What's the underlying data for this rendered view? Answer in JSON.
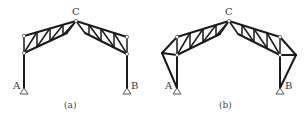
{
  "figures": [
    {
      "id": "a",
      "caption": "(a)",
      "labels": {
        "apex": "C",
        "left_support": "A",
        "right_support": "B"
      }
    },
    {
      "id": "b",
      "caption": "(b)",
      "labels": {
        "apex": "C",
        "left_support": "A",
        "right_support": "B"
      }
    }
  ],
  "colors": {
    "line": "#1a1a1a",
    "background": "#ffffff"
  }
}
